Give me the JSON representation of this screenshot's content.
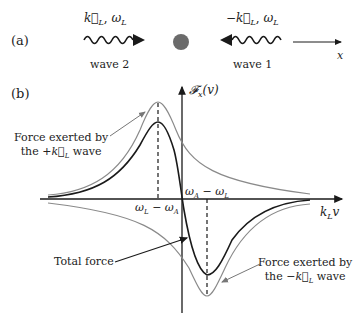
{
  "panel_a": {
    "label": "(a)",
    "wave2": {
      "vector": "k⃗",
      "sub": "L",
      "omega": "ω",
      "omega_sub": "L",
      "caption": "wave 2",
      "prefix": ""
    },
    "wave1": {
      "vector": "k⃗",
      "sub": "L",
      "omega": "ω",
      "omega_sub": "L",
      "caption": "wave 1",
      "prefix": "−"
    },
    "atom": {
      "color": "#6b6b6b"
    },
    "x_axis_label": "x"
  },
  "panel_b": {
    "label": "(b)",
    "y_axis_label": "𝓕",
    "y_axis_sub": "x",
    "y_axis_arg": "(v)",
    "x_axis_label": "k",
    "x_axis_sub": "L",
    "x_axis_var": "v",
    "tick_left": "ω_L − ω_A",
    "tick_left_parts": {
      "a": "ω",
      "a_sub": "L",
      "op": " − ",
      "b": "ω",
      "b_sub": "A"
    },
    "tick_right_parts": {
      "a": "ω",
      "a_sub": "A",
      "op": " − ",
      "b": "ω",
      "b_sub": "L"
    },
    "annotations": {
      "plus_wave_line1": "Force exerted by",
      "plus_wave_line2_pre": "the +",
      "plus_wave_vec": "k⃗",
      "plus_wave_sub": "L",
      "plus_wave_post": " wave",
      "total": "Total force",
      "minus_wave_line1": "Force exerted by",
      "minus_wave_line2_pre": "the −",
      "minus_wave_vec": "k⃗",
      "minus_wave_sub": "L",
      "minus_wave_post": " wave"
    },
    "colors": {
      "total": "#1a1a1a",
      "component": "#8a8a8a",
      "axis": "#1a1a1a"
    }
  }
}
